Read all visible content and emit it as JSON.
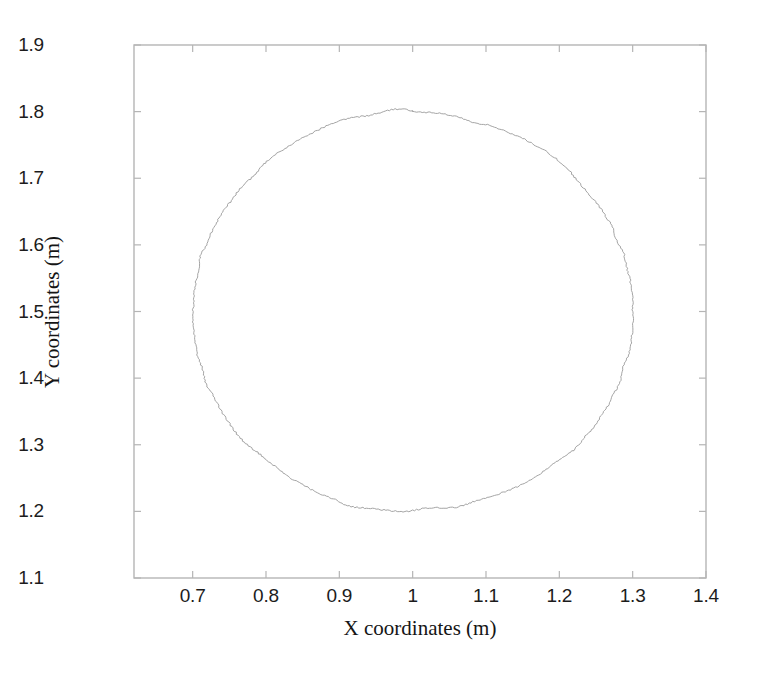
{
  "figure": {
    "background_color": "#ffffff",
    "width": 757,
    "height": 674
  },
  "chart_data": {
    "type": "line",
    "title": "",
    "subtitle": "",
    "xlabel": "X coordinates (m)",
    "ylabel": "Y coordinates (m)",
    "xlim": [
      0.62,
      1.4
    ],
    "ylim": [
      1.1,
      1.9
    ],
    "xticks": [
      0.7,
      0.8,
      0.9,
      1,
      1.1,
      1.2,
      1.3,
      1.4
    ],
    "yticks": [
      1.1,
      1.2,
      1.3,
      1.4,
      1.5,
      1.6,
      1.7,
      1.8,
      1.9
    ],
    "xtick_labels": [
      "0.7",
      "0.8",
      "0.9",
      "1",
      "1.1",
      "1.2",
      "1.3",
      "1.4"
    ],
    "ytick_labels": [
      "1.1",
      "1.2",
      "1.3",
      "1.4",
      "1.5",
      "1.6",
      "1.7",
      "1.8",
      "1.9"
    ],
    "grid": false,
    "legend": null,
    "annotations": [],
    "series": [
      {
        "name": "measured trajectory",
        "description": "closed near-circular path traced counter-clockwise with small measurement noise",
        "line_color": "#9a9a9a",
        "line_width": 0.9,
        "shape": "circle",
        "center": [
          1.0,
          1.5
        ],
        "radius_x": 0.3,
        "radius_y": 0.3,
        "noise_amplitude": 0.004,
        "n_points": 720,
        "extrema": {
          "x_min": 0.7,
          "x_max": 1.3,
          "y_min": 1.2,
          "y_max": 1.8
        }
      }
    ]
  },
  "axes": {
    "box_color": "#b5b5b5",
    "tick_color": "#b5b5b5",
    "tick_label_color": "#1c1c1c",
    "plot_left_px": 134,
    "plot_right_px": 706,
    "plot_top_px": 45,
    "plot_bottom_px": 578
  }
}
